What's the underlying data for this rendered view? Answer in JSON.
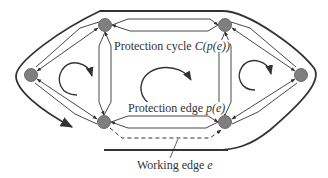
{
  "diagram": {
    "type": "network protection cycle diagram",
    "colors": {
      "node_fill": "#7f7f7f",
      "node_stroke": "#555555",
      "edge": "#333333",
      "background": "#ffffff"
    },
    "nodes": [
      {
        "id": "top-left",
        "x": 105,
        "y": 25
      },
      {
        "id": "top-right",
        "x": 225,
        "y": 25
      },
      {
        "id": "left",
        "x": 31,
        "y": 75
      },
      {
        "id": "right",
        "x": 301,
        "y": 75
      },
      {
        "id": "bottom-left",
        "x": 104,
        "y": 122
      },
      {
        "id": "bottom-right",
        "x": 225,
        "y": 122
      }
    ],
    "labels": {
      "protection_cycle_prefix": "Protection cycle ",
      "protection_cycle_math": "C(p(e))",
      "protection_edge_prefix": "Protection edge ",
      "protection_edge_math": "p(e)",
      "working_edge_prefix": "Working edge ",
      "working_edge_math": "e"
    }
  }
}
